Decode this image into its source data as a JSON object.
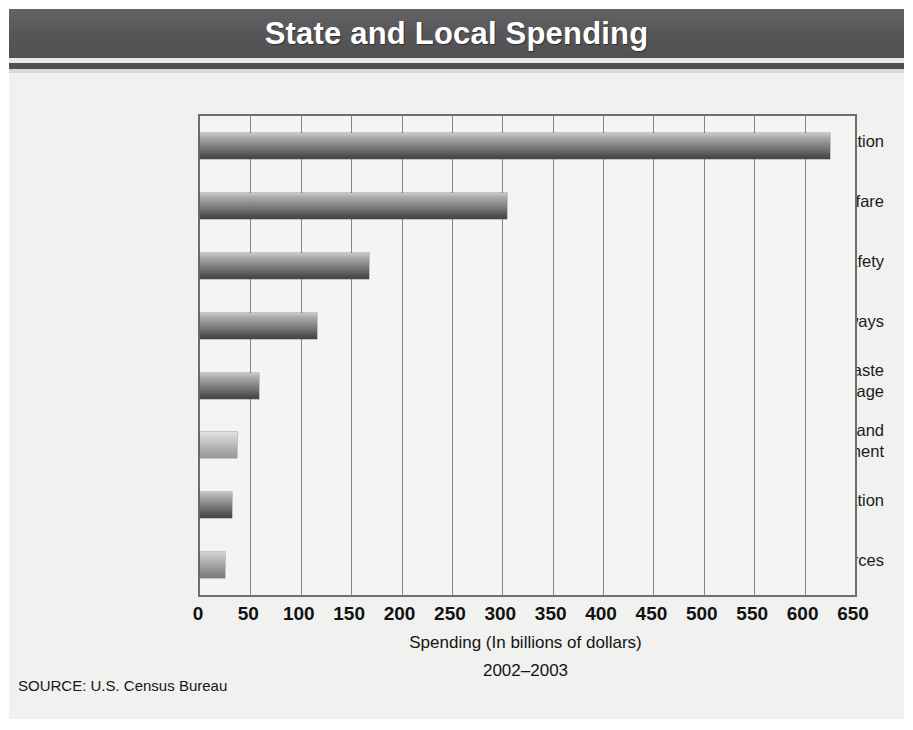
{
  "header": {
    "title": "State and Local Spending"
  },
  "source_note": "SOURCE: U.S. Census Bureau",
  "chart_data": {
    "type": "bar",
    "orientation": "horizontal",
    "title": "State and Local Spending",
    "subtitle": "2002–2003",
    "xlabel": "Spending (In billions of dollars)",
    "ylabel": "",
    "xlim": [
      0,
      650
    ],
    "xticks": [
      0,
      50,
      100,
      150,
      200,
      250,
      300,
      350,
      400,
      450,
      500,
      550,
      600,
      650
    ],
    "xtick_labels": [
      "0",
      "50",
      "100",
      "150",
      "200",
      "250",
      "300",
      "350",
      "400",
      "450",
      "500",
      "550",
      "600",
      "650"
    ],
    "grid": "vertical",
    "legend": "none",
    "categories": [
      "Education",
      "Public Welfare",
      "Public Safety",
      "Highways",
      "Solid Waste and Sewage",
      "Housing and Community Development",
      "Parks and Recreation",
      "Natural Resources"
    ],
    "category_label_lines": [
      [
        "Education"
      ],
      [
        "Public Welfare"
      ],
      [
        "Public Safety"
      ],
      [
        "Highways"
      ],
      [
        "Solid Waste",
        "and Sewage"
      ],
      [
        "Housing and",
        "Community Development"
      ],
      [
        "Parks and Recreation"
      ],
      [
        "Natural Resources"
      ]
    ],
    "values": [
      625,
      305,
      168,
      116,
      59,
      37,
      32,
      25
    ],
    "bar_shades": [
      "dark",
      "dark",
      "dark",
      "dark",
      "dark",
      "light",
      "dark",
      "mid"
    ],
    "period": "2002–2003",
    "source": "U.S. Census Bureau"
  },
  "colors": {
    "header_band": "#58585a",
    "panel_background": "#f1f1ef",
    "plot_background": "#f4f4f2",
    "axis_line": "#6e6e70",
    "gridline": "#85858a",
    "bar_dark": "#4e4e50",
    "bar_light": "#c9c9c7",
    "text": "#1b1b1b",
    "title_text": "#ffffff"
  }
}
